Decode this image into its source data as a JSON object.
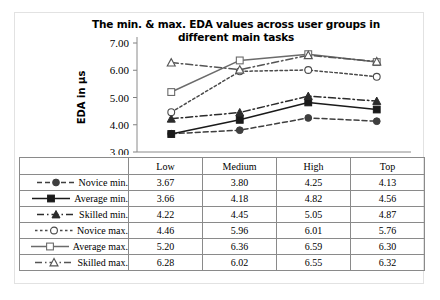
{
  "chart_data": {
    "type": "line",
    "title": "The min. & max. EDA values across user groups in different main tasks",
    "title_line1": "The min. & max. EDA values across user groups in",
    "title_line2": "different main tasks",
    "xlabel": "",
    "ylabel": "EDA in µs",
    "categories": [
      "Low",
      "Medium",
      "High",
      "Top"
    ],
    "ylim": [
      3.0,
      7.0
    ],
    "yticks": [
      "3.00",
      "4.00",
      "5.00",
      "6.00",
      "7.00"
    ],
    "ytick_values": [
      3.0,
      4.0,
      5.0,
      6.0,
      7.0
    ],
    "grid": false,
    "legend_position": "table-left",
    "series": [
      {
        "name": "Novice min.",
        "values": [
          3.67,
          3.8,
          4.25,
          4.13
        ],
        "marker": "filled-circle",
        "dash": "dashed",
        "color": "#3f3f3f"
      },
      {
        "name": "Average min.",
        "values": [
          3.66,
          4.18,
          4.82,
          4.56
        ],
        "marker": "filled-square",
        "dash": "solid",
        "color": "#1a1a1a"
      },
      {
        "name": "Skilled min.",
        "values": [
          4.22,
          4.45,
          5.05,
          4.87
        ],
        "marker": "filled-triangle",
        "dash": "dash-dot",
        "color": "#2b2b2b"
      },
      {
        "name": "Novice max.",
        "values": [
          4.46,
          5.96,
          6.01,
          5.76
        ],
        "marker": "open-circle",
        "dash": "dotted",
        "color": "#4a4a4a"
      },
      {
        "name": "Average max.",
        "values": [
          5.2,
          6.36,
          6.59,
          6.3
        ],
        "marker": "open-square",
        "dash": "solid",
        "color": "#6b6b6b"
      },
      {
        "name": "Skilled max.",
        "values": [
          6.28,
          6.02,
          6.55,
          6.32
        ],
        "marker": "open-triangle",
        "dash": "dash-dot",
        "color": "#555555"
      }
    ]
  },
  "table": {
    "corner_label": "",
    "columns": [
      "Low",
      "Medium",
      "High",
      "Top"
    ],
    "rows": [
      {
        "label": "Novice min.",
        "values": [
          "3.67",
          "3.80",
          "4.25",
          "4.13"
        ]
      },
      {
        "label": "Average min.",
        "values": [
          "3.66",
          "4.18",
          "4.82",
          "4.56"
        ]
      },
      {
        "label": "Skilled min.",
        "values": [
          "4.22",
          "4.45",
          "5.05",
          "4.87"
        ]
      },
      {
        "label": "Novice max.",
        "values": [
          "4.46",
          "5.96",
          "6.01",
          "5.76"
        ]
      },
      {
        "label": "Average max.",
        "values": [
          "5.20",
          "6.36",
          "6.59",
          "6.30"
        ]
      },
      {
        "label": "Skilled max.",
        "values": [
          "6.28",
          "6.02",
          "6.55",
          "6.32"
        ]
      }
    ]
  }
}
